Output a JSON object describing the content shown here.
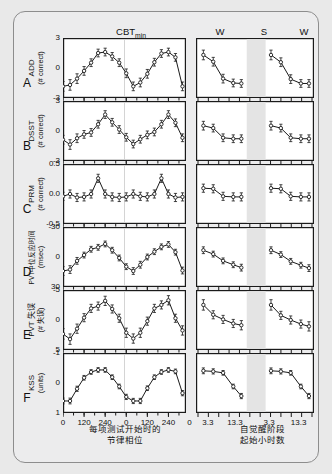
{
  "figure": {
    "background_color": "#ececed",
    "card_border_color": "#8d8d8d",
    "headers": {
      "cbt_min": "CBT",
      "cbt_min_sub": "min",
      "wake1": "W",
      "sleep": "S",
      "wake2": "W"
    },
    "xaxis_left_caption_line1": "每项测试开始时的",
    "xaxis_left_caption_line2": "节律相位",
    "xaxis_right_caption_line1": "自觉醒阶段",
    "xaxis_right_caption_line2": "起始小时数",
    "xticks_left": [
      "0",
      "120",
      "240",
      "0",
      "120",
      "240",
      "0"
    ],
    "xticks_right": [
      "3.3",
      "13.3",
      "3.3",
      "13.3"
    ]
  },
  "chart_data": [
    {
      "type": "line",
      "panel": "A",
      "letter": "A",
      "ylabel_line1": "ADD",
      "ylabel_line2": "(# correct)",
      "yticks": [
        "3",
        "0",
        "-3"
      ],
      "ylim": [
        -3,
        3
      ],
      "inverted": false,
      "title": "ADD (# correct)",
      "xlabel": "每项测试开始时的节律相位",
      "ylabel": "ADD (# correct)",
      "circadian": {
        "x": [
          0,
          40,
          80,
          120,
          160,
          200,
          240,
          280,
          320,
          360,
          400,
          440,
          480,
          520,
          560,
          600,
          640,
          680
        ],
        "y": [
          -1.9,
          -1.75,
          -1.1,
          -0.3,
          0.55,
          1.55,
          1.65,
          1.2,
          0.55,
          -0.55,
          -1.9,
          -1.5,
          -0.6,
          0.6,
          1.5,
          1.65,
          1.1,
          -1.9
        ],
        "err": [
          0.5,
          0.55,
          0.5,
          0.45,
          0.4,
          0.4,
          0.4,
          0.4,
          0.4,
          0.45,
          0.45,
          0.45,
          0.45,
          0.4,
          0.4,
          0.4,
          0.4,
          0.45
        ]
      },
      "wake1": {
        "x": [
          3.3,
          6.6,
          9.9,
          13.3,
          16.0
        ],
        "y": [
          1.35,
          0.65,
          -1.1,
          -1.55,
          -1.6
        ],
        "err": [
          0.5,
          0.45,
          0.45,
          0.4,
          0.4
        ]
      },
      "wake2": {
        "x": [
          3.3,
          6.6,
          9.9,
          13.3,
          16.0
        ],
        "y": [
          1.35,
          0.6,
          -1.15,
          -1.6,
          -1.6
        ],
        "err": [
          0.5,
          0.45,
          0.45,
          0.4,
          0.4
        ]
      }
    },
    {
      "type": "line",
      "panel": "B",
      "letter": "B",
      "ylabel_line1": "DSST",
      "ylabel_line2": "(# correct)",
      "yticks": [
        "3",
        "0",
        "-3"
      ],
      "ylim": [
        -3,
        3
      ],
      "inverted": false,
      "title": "DSST (# correct)",
      "xlabel": "每项测试开始时的节律相位",
      "ylabel": "DSST (# correct)",
      "circadian": {
        "x": [
          0,
          40,
          80,
          120,
          160,
          200,
          240,
          280,
          320,
          360,
          400,
          440,
          480,
          520,
          560,
          600,
          640,
          680
        ],
        "y": [
          -0.9,
          -1.4,
          -0.75,
          -0.35,
          -0.15,
          0.7,
          1.7,
          0.9,
          0.15,
          -0.65,
          -1.35,
          -0.85,
          -0.4,
          -0.1,
          0.7,
          1.7,
          0.85,
          -0.7
        ],
        "err": [
          0.45,
          0.5,
          0.45,
          0.4,
          0.4,
          0.4,
          0.4,
          0.4,
          0.4,
          0.4,
          0.4,
          0.4,
          0.4,
          0.4,
          0.4,
          0.4,
          0.4,
          0.4
        ]
      },
      "wake1": {
        "x": [
          3.3,
          6.6,
          9.9,
          13.3,
          16.0
        ],
        "y": [
          0.55,
          0.3,
          -0.7,
          -0.8,
          -0.8
        ],
        "err": [
          0.45,
          0.4,
          0.4,
          0.4,
          0.4
        ]
      },
      "wake2": {
        "x": [
          3.3,
          6.6,
          9.9,
          13.3,
          16.0
        ],
        "y": [
          0.55,
          0.3,
          -0.7,
          -0.8,
          -0.8
        ],
        "err": [
          0.45,
          0.4,
          0.4,
          0.4,
          0.4
        ]
      }
    },
    {
      "type": "line",
      "panel": "C",
      "letter": "C",
      "ylabel_line1": "PRM",
      "ylabel_line2": "(# correct)",
      "yticks": [
        "0.5",
        "0.0",
        "-0.5"
      ],
      "ylim": [
        -0.5,
        0.5
      ],
      "inverted": false,
      "title": "PRM (# correct)",
      "xlabel": "每项测试开始时的节律相位",
      "ylabel": "PRM (# correct)",
      "circadian": {
        "x": [
          0,
          40,
          80,
          120,
          160,
          200,
          240,
          280,
          320,
          360,
          400,
          440,
          480,
          520,
          560,
          600,
          640,
          680
        ],
        "y": [
          -0.04,
          0.0,
          -0.06,
          -0.05,
          0.0,
          0.27,
          0.0,
          -0.05,
          -0.06,
          -0.05,
          0.0,
          -0.04,
          -0.05,
          0.0,
          0.27,
          0.0,
          -0.06,
          -0.05
        ],
        "err": [
          0.07,
          0.07,
          0.07,
          0.07,
          0.07,
          0.07,
          0.07,
          0.07,
          0.07,
          0.07,
          0.07,
          0.07,
          0.07,
          0.07,
          0.07,
          0.07,
          0.07,
          0.07
        ]
      },
      "wake1": {
        "x": [
          3.3,
          6.6,
          9.9,
          13.3,
          16.0
        ],
        "y": [
          0.1,
          0.09,
          -0.04,
          -0.05,
          -0.05
        ],
        "err": [
          0.07,
          0.07,
          0.07,
          0.07,
          0.07
        ]
      },
      "wake2": {
        "x": [
          3.3,
          6.6,
          9.9,
          13.3,
          16.0
        ],
        "y": [
          0.1,
          0.09,
          -0.04,
          -0.05,
          -0.05
        ],
        "err": [
          0.07,
          0.07,
          0.07,
          0.07,
          0.07
        ]
      }
    },
    {
      "type": "line",
      "panel": "D",
      "letter": "D",
      "ylabel_line1": "PVT中位反应时间",
      "ylabel_line2": "(msec)",
      "yticks": [
        "-30",
        "0",
        "30"
      ],
      "ylim": [
        -30,
        30
      ],
      "inverted": true,
      "title": "PVT中位反应时间 (msec)",
      "xlabel": "每项测试开始时的节律相位",
      "ylabel": "PVT中位反应时间 (msec)",
      "circadian": {
        "x": [
          0,
          40,
          80,
          120,
          160,
          200,
          240,
          280,
          320,
          360,
          400,
          440,
          480,
          520,
          560,
          600,
          640,
          680
        ],
        "y": [
          14.5,
          13.0,
          4.0,
          -2.0,
          -8.0,
          -10.0,
          -13.5,
          -7.0,
          1.0,
          10.0,
          14.5,
          8.0,
          0.0,
          -5.5,
          -10.5,
          -13.0,
          -5.0,
          14.0
        ],
        "err": [
          4.5,
          4.0,
          3.5,
          3.0,
          3.0,
          3.0,
          3.0,
          3.0,
          3.0,
          3.0,
          3.5,
          3.5,
          3.0,
          3.0,
          3.0,
          3.0,
          3.0,
          3.5
        ]
      },
      "wake1": {
        "x": [
          3.3,
          6.6,
          9.9,
          13.3,
          16.0
        ],
        "y": [
          -7.0,
          -3.0,
          4.0,
          8.0,
          11.0
        ],
        "err": [
          3.5,
          3.0,
          3.0,
          3.0,
          3.5
        ]
      },
      "wake2": {
        "x": [
          3.3,
          6.6,
          9.9,
          13.3,
          16.0
        ],
        "y": [
          -7.0,
          -2.5,
          4.5,
          8.5,
          11.5
        ],
        "err": [
          3.5,
          3.0,
          3.0,
          3.0,
          3.5
        ]
      }
    },
    {
      "type": "line",
      "panel": "E",
      "letter": "E",
      "ylabel_line1": "PVT 失误",
      "ylabel_line2": "(# 失误)",
      "yticks": [
        "-5",
        "0",
        "5"
      ],
      "ylim": [
        -5,
        5
      ],
      "inverted": true,
      "title": "PVT 失误 (# 失误)",
      "xlabel": "每项测试开始时的节律相位",
      "ylabel": "PVT 失误 (# 失误)",
      "circadian": {
        "x": [
          0,
          40,
          80,
          120,
          160,
          200,
          240,
          280,
          320,
          360,
          400,
          440,
          480,
          520,
          560,
          600,
          640,
          680
        ],
        "y": [
          2.4,
          3.3,
          1.5,
          -0.4,
          -2.0,
          -2.4,
          -3.3,
          -1.9,
          -0.3,
          2.2,
          3.2,
          2.2,
          0.2,
          -2.0,
          -2.6,
          -3.4,
          -0.3,
          1.8
        ],
        "err": [
          0.9,
          0.9,
          0.8,
          0.7,
          0.7,
          0.7,
          0.8,
          0.7,
          0.7,
          0.8,
          0.8,
          0.8,
          0.7,
          0.7,
          0.7,
          0.8,
          0.7,
          0.8
        ]
      },
      "wake1": {
        "x": [
          3.3,
          6.6,
          9.9,
          13.3,
          16.0
        ],
        "y": [
          -2.6,
          -0.9,
          -0.1,
          0.6,
          0.9
        ],
        "err": [
          0.9,
          0.7,
          0.7,
          0.7,
          0.8
        ]
      },
      "wake2": {
        "x": [
          3.3,
          6.6,
          9.9,
          13.3,
          16.0
        ],
        "y": [
          -2.6,
          -0.8,
          0.0,
          0.7,
          1.1
        ],
        "err": [
          0.9,
          0.7,
          0.7,
          0.7,
          0.8
        ]
      }
    },
    {
      "type": "line",
      "panel": "F",
      "letter": "F",
      "ylabel_line1": "KSS",
      "ylabel_line2": "(units)",
      "yticks": [
        "-1",
        "0",
        "1"
      ],
      "ylim": [
        -1,
        1
      ],
      "inverted": true,
      "title": "KSS (units)",
      "xlabel": "每项测试开始时的节律相位",
      "ylabel": "KSS (units)",
      "circadian": {
        "x": [
          0,
          40,
          80,
          120,
          160,
          200,
          240,
          280,
          320,
          360,
          400,
          440,
          480,
          520,
          560,
          600,
          640,
          680
        ],
        "y": [
          0.62,
          0.62,
          0.2,
          -0.18,
          -0.38,
          -0.45,
          -0.45,
          -0.2,
          0.12,
          0.48,
          0.62,
          0.62,
          0.18,
          -0.2,
          -0.38,
          -0.45,
          -0.4,
          0.35
        ],
        "err": [
          0.1,
          0.1,
          0.09,
          0.08,
          0.08,
          0.08,
          0.08,
          0.08,
          0.08,
          0.09,
          0.09,
          0.09,
          0.08,
          0.08,
          0.08,
          0.08,
          0.08,
          0.09
        ]
      },
      "wake1": {
        "x": [
          3.3,
          6.6,
          9.9,
          13.3,
          16.0
        ],
        "y": [
          -0.42,
          -0.4,
          -0.35,
          0.12,
          0.45
        ],
        "err": [
          0.1,
          0.09,
          0.08,
          0.08,
          0.09
        ]
      },
      "wake2": {
        "x": [
          3.3,
          6.6,
          9.9,
          13.3,
          16.0
        ],
        "y": [
          -0.42,
          -0.4,
          -0.35,
          0.12,
          0.45
        ],
        "err": [
          0.1,
          0.09,
          0.08,
          0.08,
          0.09
        ]
      }
    }
  ]
}
